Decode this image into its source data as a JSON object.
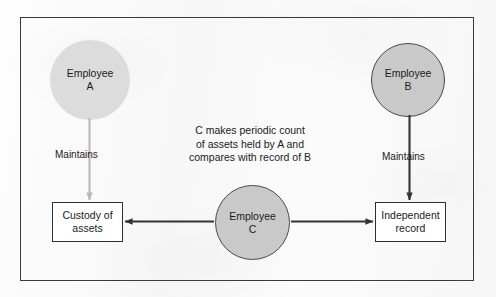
{
  "diagram": {
    "title_visible": false,
    "frame": {
      "style": "rectangle-border"
    },
    "nodes": {
      "employee_a": {
        "label_line1": "Employee",
        "label_line2": "A",
        "shape": "circle",
        "fill": "#dcdcdc"
      },
      "employee_b": {
        "label_line1": "Employee",
        "label_line2": "B",
        "shape": "circle",
        "fill": "#c9c9c9"
      },
      "employee_c": {
        "label_line1": "Employee",
        "label_line2": "C",
        "shape": "circle",
        "fill": "#c9c9c9"
      },
      "custody_box": {
        "label_line1": "Custody of",
        "label_line2": "assets",
        "shape": "rectangle",
        "fill": "#ffffff"
      },
      "record_box": {
        "label_line1": "Independent",
        "label_line2": "record",
        "shape": "rectangle",
        "fill": "#ffffff"
      }
    },
    "edges": {
      "a_to_custody": {
        "label": "Maintains",
        "color": "#b9b9b9",
        "direction": "down"
      },
      "b_to_record": {
        "label": "Maintains",
        "color": "#333333",
        "direction": "down"
      },
      "c_to_custody": {
        "label": "",
        "color": "#333333",
        "direction": "left"
      },
      "c_to_record": {
        "label": "",
        "color": "#333333",
        "direction": "right"
      }
    },
    "note": "C  makes periodic count\nof assets held by A and\ncompares with record of B",
    "colors": {
      "frame_border": "#3a3a3a",
      "node_border": "#4a4a4a",
      "text": "#1b1b1b",
      "arrow_dark": "#333333",
      "arrow_light": "#b9b9b9",
      "background": "#fbfbfb"
    }
  }
}
